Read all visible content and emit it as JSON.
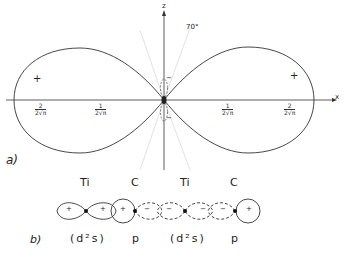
{
  "figure_a": {
    "panel_label": "a)",
    "axis_x_label": "x",
    "axis_z_label": "z",
    "angle_label": "70°",
    "left_lobe_sign": "+",
    "right_lobe_sign": "+",
    "small_lobe_top_sign": "−",
    "small_lobe_bottom_sign": "−",
    "ticks": [
      {
        "num": "2",
        "den": "2√π"
      },
      {
        "num": "1",
        "den": "2√π"
      },
      {
        "num": "1",
        "den": "2√π"
      },
      {
        "num": "2",
        "den": "2√π"
      }
    ]
  },
  "figure_b": {
    "panel_label": "b)",
    "atoms": [
      "Ti",
      "C",
      "Ti",
      "C"
    ],
    "orbitals": [
      "(d²s)",
      "p",
      "(d²s)",
      "p"
    ],
    "lobe_signs": [
      "+",
      "+",
      "+",
      "−",
      "−",
      "−",
      "−",
      "+"
    ]
  }
}
